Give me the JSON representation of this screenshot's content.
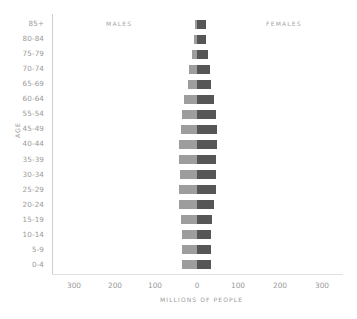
{
  "chart_data": {
    "type": "bar",
    "subtype": "population-pyramid",
    "title": "",
    "xlabel": "MILLIONS OF PEOPLE",
    "ylabel": "AGE",
    "side_labels": {
      "left": "MALES",
      "right": "FEMALES"
    },
    "categories": [
      "85+",
      "80-84",
      "75-79",
      "70-74",
      "65-69",
      "60-64",
      "55-54",
      "45-49",
      "40-44",
      "35-39",
      "30-34",
      "25-29",
      "20-24",
      "15-19",
      "10-14",
      "5-9",
      "0-4"
    ],
    "series": [
      {
        "name": "Males",
        "color": "#9d9d9d",
        "values": [
          5,
          7,
          12,
          19,
          22,
          31,
          37,
          39,
          43,
          43,
          41,
          43,
          43,
          38,
          36,
          36,
          36
        ]
      },
      {
        "name": "Females",
        "color": "#565656",
        "values": [
          21,
          22,
          26,
          31,
          33,
          41,
          45,
          48,
          48,
          45,
          45,
          45,
          41,
          36,
          33,
          33,
          33
        ]
      }
    ],
    "x_ticks": [
      "300",
      "200",
      "100",
      "0",
      "100",
      "200",
      "300"
    ],
    "xlim": [
      -350,
      350
    ],
    "grid": false,
    "legend": "none (side labels MALES / FEMALES)"
  }
}
